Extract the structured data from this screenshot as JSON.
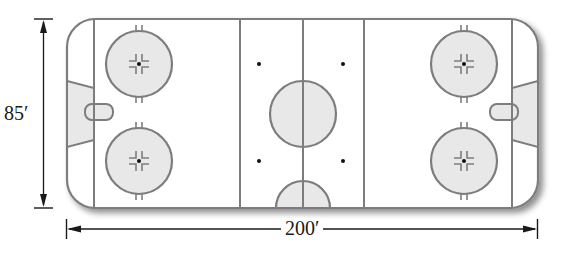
{
  "diagram": {
    "dimensions": {
      "height_label": "85′",
      "width_label": "200′"
    },
    "colors": {
      "line": "#7d7d7d",
      "fill_shaded": "#e8e8e8",
      "rink_bg": "#ffffff",
      "dimension_line": "#1a1a1a",
      "dot": "#111111",
      "shadow": "#bdbdbd"
    },
    "elements": {
      "faceoff_circles": 4,
      "neutral_zone_dots": 4,
      "center_circle": 1,
      "referee_crease": 1,
      "goal_creases": 2,
      "nets": 2,
      "blue_lines": 2,
      "center_line": 1,
      "goal_lines": 2
    }
  }
}
